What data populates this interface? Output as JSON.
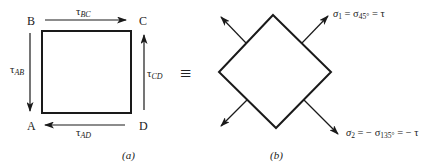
{
  "diagram": {
    "panel_a": {
      "caption": "(a)",
      "corners": {
        "A": "A",
        "B": "B",
        "C": "C",
        "D": "D"
      },
      "shear_labels": {
        "top": {
          "base": "τ",
          "sub": "BC"
        },
        "left": {
          "base": "τ",
          "sub": "AB"
        },
        "right": {
          "base": "τ",
          "sub": "CD"
        },
        "bottom": {
          "base": "τ",
          "sub": "AD"
        }
      }
    },
    "equivalence_symbol": "≡",
    "panel_b": {
      "caption": "(b)",
      "sigma1": {
        "base": "σ",
        "sub": "1",
        "eq1": " = σ",
        "sub2": "45°",
        "eq2": " = τ"
      },
      "sigma2": {
        "base": "σ",
        "sub": "2",
        "eq1": " = − σ",
        "sub2": "135°",
        "eq2": " = − τ"
      }
    },
    "colors": {
      "ink": "#1a1a1a",
      "background": "#ffffff"
    }
  }
}
